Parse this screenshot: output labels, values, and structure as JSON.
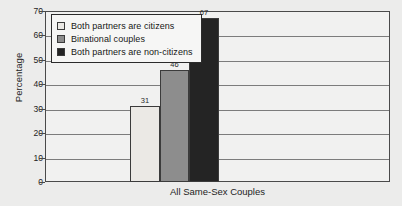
{
  "chart_data": {
    "type": "bar",
    "title": "",
    "xlabel": "All Same-Sex Couples",
    "ylabel": "Percentage",
    "categories": [
      "All Same-Sex Couples"
    ],
    "ylim": [
      0,
      70
    ],
    "yticks": [
      0,
      10,
      20,
      30,
      40,
      50,
      60,
      70
    ],
    "grid": true,
    "legend_position": "top-left",
    "series": [
      {
        "name": "Both partners are citizens",
        "values": [
          31
        ],
        "color": "#ebe9e5"
      },
      {
        "name": "Binational couples",
        "values": [
          46
        ],
        "color": "#8d8d8d"
      },
      {
        "name": "Both partners are non-citizens",
        "values": [
          67
        ],
        "color": "#242424"
      }
    ],
    "data_labels": [
      "31",
      "46",
      "67"
    ]
  },
  "axes": {
    "y_title": "Percentage",
    "x_title": "All Same-Sex Couples",
    "y_tick_labels": [
      "0",
      "10",
      "20",
      "30",
      "40",
      "50",
      "60",
      "70"
    ]
  },
  "legend": {
    "items": [
      {
        "label": "Both partners are citizens",
        "color": "#ebe9e5"
      },
      {
        "label": "Binational couples",
        "color": "#8d8d8d"
      },
      {
        "label": "Both partners are non-citizens",
        "color": "#242424"
      }
    ]
  }
}
